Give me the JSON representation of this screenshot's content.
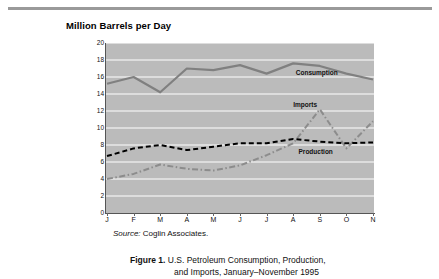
{
  "figure": {
    "chart_title": "Million Barrels per Day",
    "source_prefix": "Source:",
    "source_text": " Coglin Associates.",
    "caption_label": "Figure 1.",
    "caption_line1": "  U.S. Petroleum Consumption, Production,",
    "caption_line2": "and Imports, January–November 1995"
  },
  "colors": {
    "plot_background": "#bbbbbb",
    "gridline": "#ffffff",
    "consumption": "#808080",
    "imports": "#8c8c8c",
    "production": "#000000",
    "axis": "#555555",
    "rule": "#9a9a9a"
  },
  "chart_data": {
    "type": "line",
    "title": "Million Barrels per Day",
    "xlabel": "",
    "ylabel": "Million Barrels per Day",
    "ylim": [
      0,
      20
    ],
    "yticks": [
      0,
      2,
      4,
      6,
      8,
      10,
      12,
      14,
      16,
      18,
      20
    ],
    "grid": true,
    "legend_position": "inline-annotations",
    "categories": [
      "J",
      "F",
      "M",
      "A",
      "M",
      "J",
      "J",
      "A",
      "S",
      "O",
      "N"
    ],
    "category_names": [
      "January",
      "February",
      "March",
      "April",
      "May",
      "June",
      "July",
      "August",
      "September",
      "October",
      "November"
    ],
    "series": [
      {
        "name": "Consumption",
        "style": "solid",
        "color": "#808080",
        "values": [
          15.2,
          16.0,
          14.2,
          17.0,
          16.8,
          17.4,
          16.4,
          17.6,
          17.3,
          16.4,
          15.7
        ],
        "label_x_index": 7.1,
        "label_y": 16.3
      },
      {
        "name": "Imports",
        "style": "dash-dot",
        "color": "#8c8c8c",
        "values": [
          4.0,
          4.6,
          5.7,
          5.2,
          5.0,
          5.6,
          6.8,
          8.2,
          12.2,
          7.6,
          10.8
        ],
        "label_x_index": 7.0,
        "label_y": 12.6
      },
      {
        "name": "Production",
        "style": "dashed",
        "color": "#000000",
        "values": [
          6.7,
          7.6,
          8.0,
          7.4,
          7.8,
          8.2,
          8.2,
          8.7,
          8.4,
          8.2,
          8.3
        ],
        "label_x_index": 7.2,
        "label_y": 7.1
      }
    ]
  }
}
